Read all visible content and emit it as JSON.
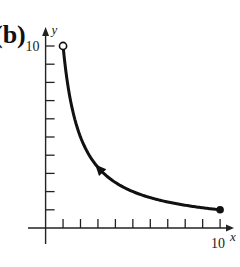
{
  "panel_label": "(b)",
  "chart_data": {
    "type": "line",
    "title": "",
    "xlabel": "x",
    "ylabel": "y",
    "xlim": [
      0,
      10
    ],
    "ylim": [
      0,
      10
    ],
    "x_tick_count": 10,
    "y_tick_count": 10,
    "x_tick_labels": [
      {
        "value": 10,
        "label": "10"
      }
    ],
    "y_tick_labels": [
      {
        "value": 10,
        "label": "10"
      }
    ],
    "grid": false,
    "series": [
      {
        "name": "curve",
        "function": "y = 10/x",
        "x": [
          1,
          1.25,
          1.5,
          2,
          2.5,
          3,
          4,
          5,
          6,
          7,
          8,
          9,
          10
        ],
        "y": [
          10,
          8,
          6.67,
          5,
          4,
          3.33,
          2.5,
          2,
          1.67,
          1.43,
          1.25,
          1.11,
          1
        ],
        "start_point": {
          "x": 1,
          "y": 10,
          "marker": "open-circle"
        },
        "end_point": {
          "x": 10,
          "y": 1,
          "marker": "filled-circle"
        },
        "direction_arrow": {
          "at_x": 3.1,
          "direction": "toward decreasing x (up-left)"
        }
      }
    ]
  }
}
